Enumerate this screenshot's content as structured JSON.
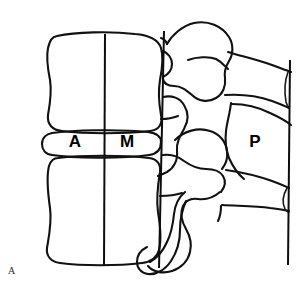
{
  "figure": {
    "panel_label": "A",
    "background_color": "#ffffff",
    "stroke_color": "#111111",
    "width": 308,
    "height": 294
  },
  "labels": {
    "anterior": {
      "text": "A",
      "x": 75,
      "y": 143
    },
    "middle": {
      "text": "M",
      "x": 127,
      "y": 143
    },
    "posterior": {
      "text": "P",
      "x": 255,
      "y": 143
    }
  },
  "reference_lines": [
    {
      "name": "middle-column-line",
      "x1": 105,
      "y1": 34,
      "x2": 104,
      "y2": 266
    },
    {
      "name": "posterior-body-line",
      "x1": 164,
      "y1": 31,
      "x2": 160,
      "y2": 268
    },
    {
      "name": "posterior-element-line",
      "x1": 290,
      "y1": 60,
      "x2": 288,
      "y2": 265
    }
  ],
  "anatomy": {
    "upper_vertebral_body": "superior lumbar vertebral body, lateral view",
    "lower_vertebral_body": "inferior lumbar vertebral body, lateral view",
    "intervertebral_disc": "intervertebral disc space between bodies",
    "posterior_elements": "pedicles, facet joints, laminae and spinous processes"
  }
}
